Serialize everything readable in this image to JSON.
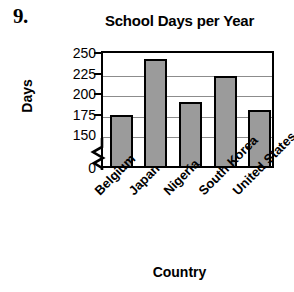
{
  "problem": {
    "number": "9."
  },
  "axis_titles": {
    "y": "Days",
    "x": "Country"
  },
  "chart_data": {
    "type": "bar",
    "title": "School Days per Year",
    "xlabel": "Country",
    "ylabel": "Days",
    "categories": [
      "Belgium",
      "Japan",
      "Nigeria",
      "South Korea",
      "United States"
    ],
    "values": [
      175,
      243,
      190,
      222,
      180
    ],
    "yticks": [
      0,
      150,
      175,
      200,
      225,
      250
    ],
    "ytick_labels": [
      "0",
      "150",
      "175",
      "200",
      "225",
      "250"
    ],
    "ylim": [
      150,
      250
    ],
    "axis_break": true,
    "axis_break_between": [
      0,
      150
    ],
    "grid": true,
    "gridlines_at": [
      150,
      175,
      200,
      225
    ],
    "legend": "none",
    "bar_color": "#9b9b9b",
    "bar_edge_color": "#000000",
    "grid_color": "#8c8c8c",
    "background": "#ffffff"
  }
}
